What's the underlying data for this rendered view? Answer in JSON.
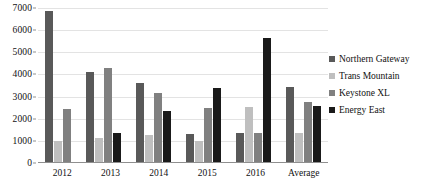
{
  "chart_data": {
    "type": "bar",
    "title": "",
    "subtitle": "",
    "xlabel": "",
    "ylabel": "",
    "categories": [
      "2012",
      "2013",
      "2014",
      "2015",
      "2016",
      "Average"
    ],
    "series": [
      {
        "name": "Northern Gateway",
        "color": "#595959",
        "values": [
          6850,
          4100,
          3600,
          1300,
          1350,
          3450
        ]
      },
      {
        "name": "Trans Mountain",
        "color": "#bfbfbf",
        "values": [
          1000,
          1150,
          1280,
          1000,
          2550,
          1350
        ]
      },
      {
        "name": "Keystone XL",
        "color": "#808080",
        "values": [
          2430,
          4300,
          3150,
          2500,
          1350,
          2750
        ]
      },
      {
        "name": "Energy East",
        "color": "#1a1a1a",
        "values": [
          null,
          1350,
          2350,
          3400,
          5650,
          2580
        ]
      }
    ],
    "ylim": [
      0,
      7000
    ],
    "yticks": [
      0,
      1000,
      2000,
      3000,
      4000,
      5000,
      6000,
      7000
    ],
    "ytick_labels": [
      "0",
      "1000",
      "2000",
      "3000",
      "4000",
      "5000",
      "6000",
      "7000"
    ],
    "grid": true,
    "grid_axis": "y",
    "legend_position": "right",
    "legend": [
      "Northern Gateway",
      "Trans Mountain",
      "Keystone XL",
      "Energy East"
    ]
  }
}
